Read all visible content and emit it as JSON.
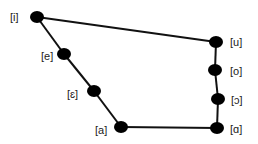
{
  "colors": {
    "line": "#111111",
    "dot": "#000000",
    "label": "#222222",
    "background": "#ffffff"
  },
  "vowels": [
    {
      "symbol": "[i]",
      "x": 37,
      "y": 17,
      "label_x": 10,
      "label_y": 11
    },
    {
      "symbol": "[e]",
      "x": 64,
      "y": 54,
      "label_x": 41,
      "label_y": 50
    },
    {
      "symbol": "[ɛ]",
      "x": 94,
      "y": 91,
      "label_x": 67,
      "label_y": 88
    },
    {
      "symbol": "[a]",
      "x": 121,
      "y": 127,
      "label_x": 95,
      "label_y": 124
    },
    {
      "symbol": "[u]",
      "x": 216,
      "y": 42,
      "label_x": 230,
      "label_y": 36
    },
    {
      "symbol": "[o]",
      "x": 215,
      "y": 70,
      "label_x": 230,
      "label_y": 65
    },
    {
      "symbol": "[ɔ]",
      "x": 218,
      "y": 99,
      "label_x": 231,
      "label_y": 94
    },
    {
      "symbol": "[ɑ]",
      "x": 217,
      "y": 128,
      "label_x": 230,
      "label_y": 123
    }
  ],
  "edges": [
    [
      "[i]",
      "[u]"
    ],
    [
      "[i]",
      "[e]"
    ],
    [
      "[e]",
      "[ɛ]"
    ],
    [
      "[ɛ]",
      "[a]"
    ],
    [
      "[a]",
      "[ɑ]"
    ],
    [
      "[u]",
      "[o]"
    ],
    [
      "[o]",
      "[ɔ]"
    ],
    [
      "[ɔ]",
      "[ɑ]"
    ]
  ]
}
